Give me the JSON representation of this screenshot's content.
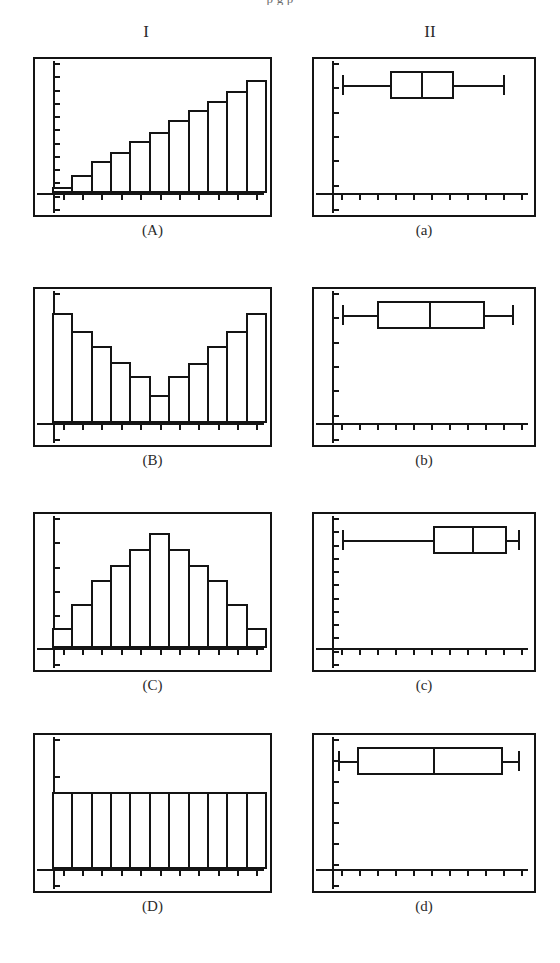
{
  "page": {
    "top_cut_text": "p g p",
    "background": "#ffffff",
    "ink_color": "#141414"
  },
  "headers": {
    "column_1": "I",
    "column_2": "II"
  },
  "chart_data": [
    {
      "id": "A",
      "label": "(A)",
      "type": "bar",
      "title": "",
      "xlabel": "",
      "ylabel": "",
      "shape": "increasing / left-skewed ramp",
      "categories": [
        "1",
        "2",
        "3",
        "4",
        "5",
        "6",
        "7",
        "8",
        "9",
        "10",
        "11"
      ],
      "values": [
        5,
        14,
        25,
        32,
        41,
        48,
        57,
        65,
        72,
        80,
        88
      ],
      "ylim": [
        0,
        100
      ],
      "grid": false,
      "legend": "none",
      "x_ticks": 11,
      "y_ticks": 12
    },
    {
      "id": "a",
      "label": "(a)",
      "type": "boxplot",
      "title": "",
      "xlabel": "",
      "ylabel": "",
      "min": 0.05,
      "q1": 0.3,
      "median": 0.46,
      "q3": 0.63,
      "max": 0.88,
      "xlim": [
        0,
        1
      ],
      "grid": false,
      "legend": "none",
      "x_ticks": 11,
      "y_ticks": 7
    },
    {
      "id": "B",
      "label": "(B)",
      "type": "bar",
      "title": "",
      "xlabel": "",
      "ylabel": "",
      "shape": "U-shaped / bimodal",
      "categories": [
        "1",
        "2",
        "3",
        "4",
        "5",
        "6",
        "7",
        "8",
        "9",
        "10",
        "11"
      ],
      "values": [
        86,
        72,
        60,
        48,
        37,
        22,
        37,
        47,
        60,
        72,
        86
      ],
      "ylim": [
        0,
        100
      ],
      "grid": false,
      "legend": "none",
      "x_ticks": 11,
      "y_ticks": 7
    },
    {
      "id": "b",
      "label": "(b)",
      "type": "boxplot",
      "title": "",
      "xlabel": "",
      "ylabel": "",
      "min": 0.05,
      "q1": 0.23,
      "median": 0.5,
      "q3": 0.79,
      "max": 0.93,
      "xlim": [
        0,
        1
      ],
      "grid": false,
      "legend": "none",
      "x_ticks": 11,
      "y_ticks": 7
    },
    {
      "id": "C",
      "label": "(C)",
      "type": "bar",
      "title": "",
      "xlabel": "",
      "ylabel": "",
      "shape": "bell-shaped / symmetric",
      "categories": [
        "1",
        "2",
        "3",
        "4",
        "5",
        "6",
        "7",
        "8",
        "9",
        "10",
        "11"
      ],
      "values": [
        16,
        34,
        53,
        65,
        77,
        90,
        77,
        65,
        53,
        34,
        16
      ],
      "ylim": [
        0,
        100
      ],
      "grid": false,
      "legend": "none",
      "x_ticks": 11,
      "y_ticks": 7
    },
    {
      "id": "c",
      "label": "(c)",
      "type": "boxplot",
      "title": "",
      "xlabel": "",
      "ylabel": "",
      "min": 0.05,
      "q1": 0.52,
      "median": 0.72,
      "q3": 0.9,
      "max": 0.96,
      "xlim": [
        0,
        1
      ],
      "grid": false,
      "legend": "none",
      "x_ticks": 11,
      "y_ticks": 12
    },
    {
      "id": "D",
      "label": "(D)",
      "type": "bar",
      "title": "",
      "xlabel": "",
      "ylabel": "",
      "shape": "uniform / flat",
      "categories": [
        "1",
        "2",
        "3",
        "4",
        "5",
        "6",
        "7",
        "8",
        "9",
        "10",
        "11"
      ],
      "values": [
        60,
        60,
        60,
        60,
        60,
        60,
        60,
        60,
        60,
        60,
        60
      ],
      "ylim": [
        0,
        100
      ],
      "grid": false,
      "legend": "none",
      "x_ticks": 11,
      "y_ticks": 5
    },
    {
      "id": "d",
      "label": "(d)",
      "type": "boxplot",
      "title": "",
      "xlabel": "",
      "ylabel": "",
      "min": 0.03,
      "q1": 0.13,
      "median": 0.52,
      "q3": 0.88,
      "max": 0.96,
      "xlim": [
        0,
        1
      ],
      "grid": false,
      "legend": "none",
      "x_ticks": 11,
      "y_ticks": 8
    }
  ]
}
